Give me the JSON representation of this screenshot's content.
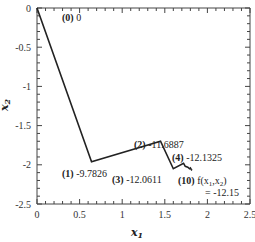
{
  "chart_data": {
    "type": "line",
    "title": "",
    "xlabel": "x",
    "xlabel_sub": "1",
    "ylabel": "x",
    "ylabel_sub": "2",
    "xlim": [
      0,
      2.5
    ],
    "ylim": [
      -2.5,
      0
    ],
    "grid": false,
    "xticks": [
      0,
      0.5,
      1,
      1.5,
      2,
      2.5
    ],
    "xtick_labels": [
      "0",
      "0.5",
      "1",
      "1.5",
      "2",
      "2.5"
    ],
    "yticks": [
      0,
      -0.5,
      -1,
      -1.5,
      -2,
      -2.5
    ],
    "ytick_labels": [
      "0",
      "-0.5",
      "-1",
      "-1.5",
      "-2",
      "-2.5"
    ],
    "series": [
      {
        "name": "optimization path",
        "color": "#222222",
        "x": [
          0,
          0.64,
          1.45,
          1.6,
          1.72,
          1.74,
          1.77,
          1.79,
          1.8,
          1.81,
          1.82
        ],
        "y": [
          0,
          -1.96,
          -1.7,
          -2.05,
          -1.98,
          -2.02,
          -2.03,
          -2.05,
          -2.04,
          -2.06,
          -2.07
        ]
      }
    ],
    "annotations": [
      {
        "step": "0",
        "text": "0",
        "anchor": "top-right",
        "x": 0,
        "y": 0
      },
      {
        "step": "1",
        "text": "-9.7826",
        "anchor": "below-left",
        "x": 0.64,
        "y": -1.96
      },
      {
        "step": "2",
        "text": "-11.6887",
        "anchor": "above-left",
        "x": 1.45,
        "y": -1.7
      },
      {
        "step": "3",
        "text": "-12.0611",
        "anchor": "below-left",
        "x": 1.6,
        "y": -2.05
      },
      {
        "step": "4",
        "text": "-12.1325",
        "anchor": "above-right",
        "x": 1.72,
        "y": -1.98
      },
      {
        "step": "10",
        "text": "f(x",
        "text_full": "f(x1,x2) = -12.15",
        "value": "= -12.15",
        "anchor": "below-right",
        "x": 1.82,
        "y": -2.07
      }
    ]
  }
}
